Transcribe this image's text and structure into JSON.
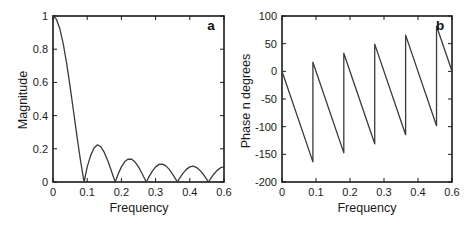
{
  "figure": {
    "background": "#ffffff",
    "axis_color": "#1a1a1a",
    "text_color": "#1a1a1a",
    "line_color": "#3a3a3a"
  },
  "chart_data": [
    {
      "type": "line",
      "panel_label": "a",
      "xlabel": "Frequency",
      "ylabel": "Magnitude",
      "xlim": [
        0,
        0.5
      ],
      "ylim": [
        0,
        1
      ],
      "grid": false,
      "legend": null,
      "x_ticks": {
        "positions": [
          0,
          0.1,
          0.2,
          0.3,
          0.4,
          0.5
        ],
        "labels": [
          "0",
          "0.1",
          "0.2",
          "0.3",
          "0.4",
          "0.6"
        ]
      },
      "y_ticks": {
        "positions": [
          0,
          0.2,
          0.4,
          0.6,
          0.8,
          1
        ],
        "labels": [
          "0",
          "0.2",
          "0.4",
          "0.6",
          "0.8",
          "1"
        ]
      },
      "series": [
        {
          "name": "magnitude",
          "x": [
            0,
            0.01,
            0.02,
            0.03,
            0.04,
            0.05,
            0.06,
            0.07,
            0.08,
            0.09,
            0.0909,
            0.1,
            0.11,
            0.12,
            0.13,
            0.14,
            0.15,
            0.16,
            0.17,
            0.18,
            0.1818,
            0.19,
            0.2,
            0.21,
            0.22,
            0.23,
            0.24,
            0.25,
            0.26,
            0.27,
            0.2727,
            0.28,
            0.29,
            0.3,
            0.31,
            0.32,
            0.33,
            0.34,
            0.35,
            0.36,
            0.3636,
            0.37,
            0.38,
            0.39,
            0.4,
            0.41,
            0.42,
            0.43,
            0.44,
            0.45,
            0.4545,
            0.46,
            0.47,
            0.48,
            0.49,
            0.5
          ],
          "y": [
            1,
            0.98,
            0.923,
            0.832,
            0.713,
            0.574,
            0.426,
            0.276,
            0.135,
            0.01,
            0,
            0.091,
            0.159,
            0.205,
            0.224,
            0.212,
            0.178,
            0.129,
            0.071,
            0.011,
            0,
            0.045,
            0.091,
            0.123,
            0.138,
            0.137,
            0.12,
            0.091,
            0.053,
            0.011,
            0,
            0.029,
            0.064,
            0.091,
            0.106,
            0.108,
            0.097,
            0.076,
            0.046,
            0.013,
            0,
            0.022,
            0.052,
            0.076,
            0.091,
            0.095,
            0.087,
            0.07,
            0.045,
            0.014,
            0,
            0.017,
            0.047,
            0.07,
            0.086,
            0.091
          ]
        }
      ]
    },
    {
      "type": "line",
      "panel_label": "b",
      "xlabel": "Frequency",
      "ylabel": "Phase n degrees",
      "xlim": [
        0,
        0.5
      ],
      "ylim": [
        -200,
        100
      ],
      "grid": false,
      "legend": null,
      "x_ticks": {
        "positions": [
          0,
          0.1,
          0.2,
          0.3,
          0.4,
          0.5
        ],
        "labels": [
          "0",
          "0.1",
          "0.2",
          "0.3",
          "0.4",
          "0.6"
        ]
      },
      "y_ticks": {
        "positions": [
          100,
          50,
          0,
          -50,
          -100,
          -150,
          -200
        ],
        "labels": [
          "100",
          "50",
          "0",
          "-50",
          "-100",
          "-150",
          "-200"
        ]
      },
      "series": [
        {
          "name": "phase",
          "x": [
            0,
            0.0909,
            0.0909,
            0.1818,
            0.1818,
            0.2727,
            0.2727,
            0.3636,
            0.3636,
            0.4545,
            0.4545,
            0.5
          ],
          "y": [
            0,
            -163.6,
            16.4,
            -147.3,
            32.7,
            -130.9,
            49.1,
            -114.5,
            65.5,
            -98.2,
            81.8,
            0
          ]
        }
      ]
    }
  ]
}
